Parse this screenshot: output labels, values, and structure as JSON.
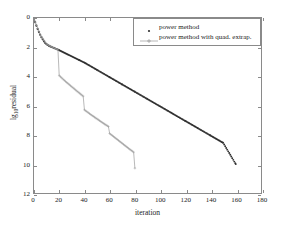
{
  "chart_data": {
    "type": "line",
    "title": "",
    "xlabel": "iteration",
    "ylabel": "lg 10 residual",
    "ylabel_base": "lg",
    "ylabel_sub": "10",
    "ylabel_rest": "residual",
    "xlim": [
      0,
      180
    ],
    "ylim": [
      -12,
      0
    ],
    "xticks": [
      0,
      20,
      40,
      60,
      80,
      100,
      120,
      140,
      160,
      180
    ],
    "xtick_labels": [
      "0",
      "20",
      "40",
      "60",
      "80",
      "100",
      "120",
      "140",
      "160",
      "180"
    ],
    "yticks": [
      0,
      -2,
      -4,
      -6,
      -8,
      -10,
      -12
    ],
    "ytick_labels": [
      "0",
      "2",
      "4",
      "6",
      "8",
      "10",
      "12"
    ],
    "grid": false,
    "legend_position": "top-right",
    "series": [
      {
        "name": "power method",
        "marker": "dot",
        "color": "#303030",
        "linestyle": "none-dense-markers",
        "points": [
          [
            0,
            -0.05
          ],
          [
            1,
            -0.3
          ],
          [
            2,
            -0.55
          ],
          [
            3,
            -0.78
          ],
          [
            4,
            -0.98
          ],
          [
            5,
            -1.16
          ],
          [
            6,
            -1.33
          ],
          [
            7,
            -1.48
          ],
          [
            8,
            -1.61
          ],
          [
            9,
            -1.72
          ],
          [
            10,
            -1.8
          ],
          [
            11,
            -1.86
          ],
          [
            12,
            -1.91
          ],
          [
            13,
            -1.95
          ],
          [
            14,
            -1.99
          ],
          [
            16,
            -2.06
          ],
          [
            18,
            -2.13
          ],
          [
            20,
            -2.21
          ],
          [
            24,
            -2.38
          ],
          [
            28,
            -2.55
          ],
          [
            32,
            -2.72
          ],
          [
            36,
            -2.89
          ],
          [
            40,
            -3.06
          ],
          [
            50,
            -3.56
          ],
          [
            60,
            -4.06
          ],
          [
            70,
            -4.56
          ],
          [
            80,
            -5.06
          ],
          [
            90,
            -5.56
          ],
          [
            100,
            -6.06
          ],
          [
            110,
            -6.56
          ],
          [
            120,
            -7.06
          ],
          [
            130,
            -7.56
          ],
          [
            140,
            -8.06
          ],
          [
            150,
            -8.56
          ],
          [
            160,
            -10.02
          ]
        ]
      },
      {
        "name": "power method with quad. extrap.",
        "marker": "plus",
        "color": "#9a9a9a",
        "linestyle": "solid-staircase",
        "points": [
          [
            0,
            -0.05
          ],
          [
            5,
            -1.16
          ],
          [
            10,
            -1.8
          ],
          [
            15,
            -2.02
          ],
          [
            19,
            -2.18
          ],
          [
            20,
            -3.95
          ],
          [
            25,
            -4.35
          ],
          [
            30,
            -4.72
          ],
          [
            35,
            -5.08
          ],
          [
            39,
            -5.36
          ],
          [
            40,
            -6.3
          ],
          [
            45,
            -6.62
          ],
          [
            50,
            -6.92
          ],
          [
            55,
            -7.22
          ],
          [
            59,
            -7.44
          ],
          [
            60,
            -7.92
          ],
          [
            65,
            -8.26
          ],
          [
            70,
            -8.6
          ],
          [
            75,
            -8.94
          ],
          [
            79,
            -9.2
          ],
          [
            80,
            -10.3
          ]
        ]
      }
    ],
    "legend_entries": [
      {
        "label": "power method",
        "marker": "dot",
        "color": "#303030"
      },
      {
        "label": "power method with quad. extrap.",
        "marker": "plus-line",
        "color": "#9a9a9a"
      }
    ]
  }
}
